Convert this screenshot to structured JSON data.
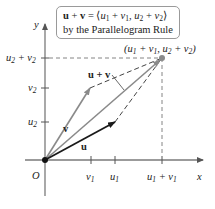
{
  "caption": {
    "line1_formula": {
      "lhs_vector_1": "u",
      "plus": " + ",
      "lhs_vector_2": "v",
      "equals": " = ",
      "open": "⟨",
      "comp1_a": "u",
      "comp1_a_sub": "1",
      "comp1_plus": " + ",
      "comp1_b": "v",
      "comp1_b_sub": "1",
      "comma": ", ",
      "comp2_a": "u",
      "comp2_a_sub": "2",
      "comp2_plus": " + ",
      "comp2_b": "v",
      "comp2_b_sub": "2",
      "close": "⟩"
    },
    "line2": "by the Parallelogram Rule"
  },
  "axes": {
    "x_label": "x",
    "y_label": "y",
    "origin_label": "O"
  },
  "x_ticks": [
    {
      "main": "v",
      "sub": "1",
      "suffix_main": "",
      "suffix_sub": ""
    },
    {
      "main": "u",
      "sub": "1",
      "suffix_main": "",
      "suffix_sub": ""
    },
    {
      "main": "u",
      "sub": "1",
      "suffix_main": " + v",
      "suffix_sub": "1"
    }
  ],
  "y_ticks": [
    {
      "main": "u",
      "sub": "2",
      "suffix_main": "",
      "suffix_sub": ""
    },
    {
      "main": "v",
      "sub": "2",
      "suffix_main": "",
      "suffix_sub": ""
    },
    {
      "main": "u",
      "sub": "2",
      "suffix_main": " + v",
      "suffix_sub": "2"
    }
  ],
  "vectors": {
    "u_label": "u",
    "v_label": "v",
    "sum_label": "u + v"
  },
  "point_label": {
    "open": "(",
    "a": "u",
    "a_sub": "1",
    "plus1": " + ",
    "b": "v",
    "b_sub": "1",
    "comma": ", ",
    "c": "u",
    "c_sub": "2",
    "plus2": " + ",
    "d": "v",
    "d_sub": "2",
    "close": ")"
  },
  "colors": {
    "u_vector": "#1a1a1a",
    "v_vector": "#8a8a8a",
    "sum_vector": "#8a8a8a",
    "axes": "#7a7a7a",
    "dashed": "#555555",
    "text": "#222222",
    "box_border": "#9a9a9a"
  }
}
